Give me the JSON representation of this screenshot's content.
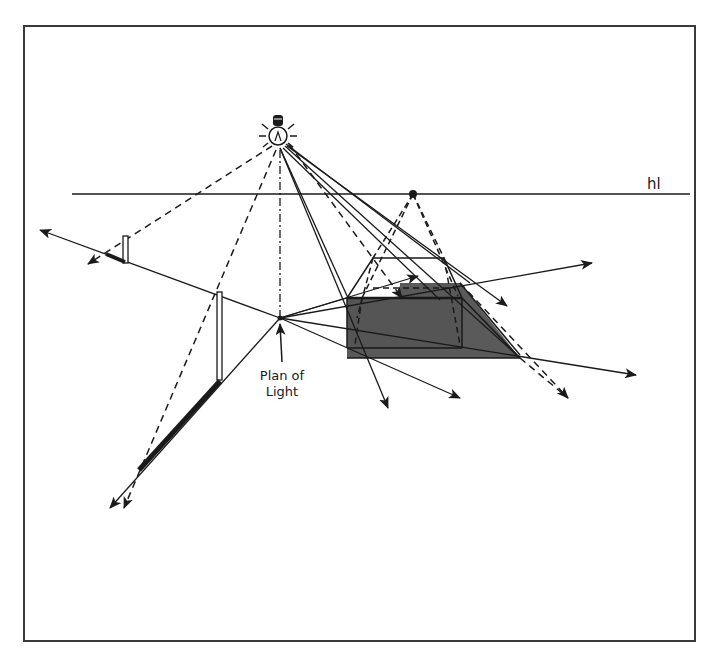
{
  "diagram": {
    "labels": {
      "horizon": "hl",
      "plan_of_light_line1": "Plan of",
      "plan_of_light_line2": "Light"
    },
    "colors": {
      "stroke": "#1a1a1a",
      "shadow_fill": "#5a5a5a",
      "background": "#ffffff",
      "frame": "#3a3a3a"
    },
    "elements": {
      "light_source": "light-bulb-icon",
      "plan_of_light_point": "plan-of-light",
      "vanishing_point": "vanishing-point-on-horizon",
      "objects": [
        "small-vertical-post",
        "tall-vertical-post",
        "rectangular-box"
      ],
      "shadows": [
        "small-post-shadow",
        "tall-post-shadow",
        "box-shadow"
      ]
    }
  }
}
